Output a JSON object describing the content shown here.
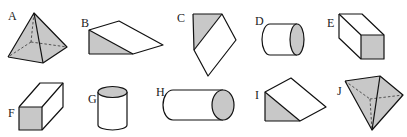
{
  "figure": {
    "shade_color": "#c8c8c8",
    "line_color": "#111111",
    "shapes": [
      {
        "label": "A",
        "type": "square pyramid (shaded, hidden edges dashed)"
      },
      {
        "label": "B",
        "type": "triangular prism / wedge (shaded triangular face)"
      },
      {
        "label": "C",
        "type": "triangular prism viewed from above (shaded triangular face)"
      },
      {
        "label": "D",
        "type": "horizontal cylinder (shaded circular end)"
      },
      {
        "label": "E",
        "type": "rectangular prism (shaded square end)"
      },
      {
        "label": "F",
        "type": "rectangular prism (shaded square front face)"
      },
      {
        "label": "G",
        "type": "vertical cylinder (shaded top face)"
      },
      {
        "label": "H",
        "type": "horizontal cylinder, long (shaded circular end)"
      },
      {
        "label": "I",
        "type": "triangular prism / wedge (shaded triangular face)"
      },
      {
        "label": "J",
        "type": "inverted triangular pyramid (shaded, hidden edges dashed)"
      }
    ]
  }
}
